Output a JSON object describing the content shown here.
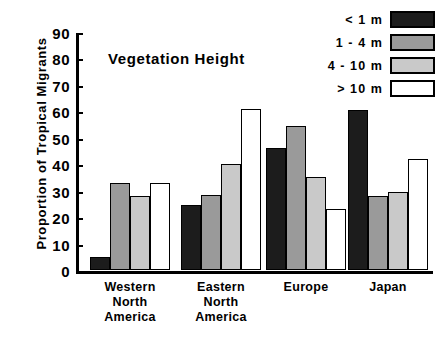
{
  "chart_data": {
    "type": "bar",
    "title": "",
    "annotation": "Vegetation  Height",
    "xlabel": "",
    "ylabel": "Proportion  of  Tropical  Migrants",
    "ylim": [
      0,
      90
    ],
    "yticks": [
      0,
      10,
      20,
      30,
      40,
      50,
      60,
      70,
      80,
      90
    ],
    "grid": false,
    "legend_position": "top-right",
    "categories": [
      "Western\nNorth\nAmerica",
      "Eastern\nNorth\nAmerica",
      "Europe",
      "Japan"
    ],
    "category_lines": [
      [
        "Western",
        "North",
        "America"
      ],
      [
        "Eastern",
        "North",
        "America"
      ],
      [
        "Europe"
      ],
      [
        "Japan"
      ]
    ],
    "series": [
      {
        "name": "<  1  m",
        "color": "#1c1c1c",
        "values": [
          5,
          24.5,
          46,
          60.5
        ]
      },
      {
        "name": "1  -  4  m",
        "color": "#9a9a9a",
        "values": [
          33,
          28.5,
          54.5,
          28
        ]
      },
      {
        "name": "4  -  10  m",
        "color": "#c9c9c9",
        "values": [
          28,
          40,
          35,
          29.5
        ]
      },
      {
        "name": ">  10  m",
        "color": "#ffffff",
        "values": [
          33,
          61,
          23,
          42
        ]
      }
    ]
  },
  "legend": {
    "items": [
      {
        "label": "<  1  m",
        "swatch": "black-swatch"
      },
      {
        "label": "1  -  4  m",
        "swatch": "dark-gray-swatch"
      },
      {
        "label": "4  -  10  m",
        "swatch": "light-gray-swatch"
      },
      {
        "label": ">  10  m",
        "swatch": "white-swatch"
      }
    ]
  },
  "axis": {
    "y_title": "Proportion  of  Tropical  Migrants",
    "y_tick_labels": [
      "90",
      "80",
      "70",
      "60",
      "50",
      "40",
      "30",
      "20",
      "10",
      "0"
    ]
  }
}
